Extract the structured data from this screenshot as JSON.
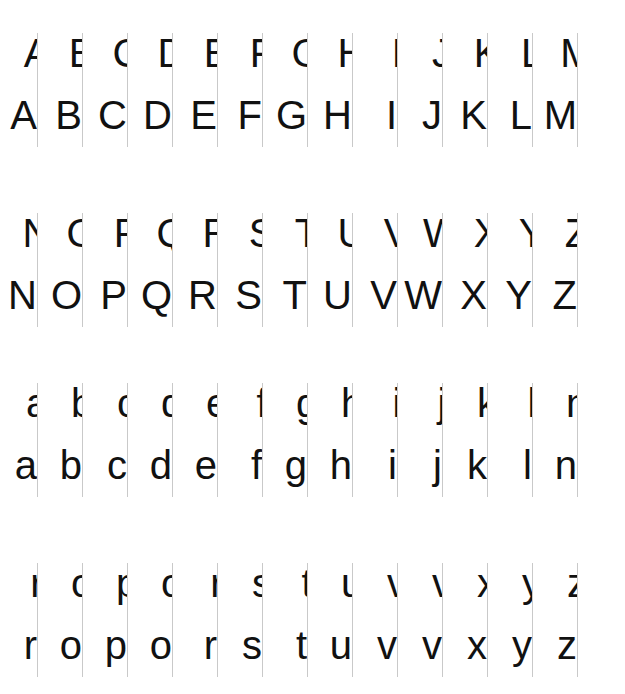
{
  "page": {
    "background_color": "#ffffff",
    "glyph_color": "#111111",
    "guide_color": "#c9c9c9",
    "width": 625,
    "height": 694
  },
  "layout": {
    "columns": 13,
    "column_spacing": 45,
    "first_column_x": 37,
    "block_tops": [
      33,
      213,
      383,
      563
    ],
    "sub_row_offset": 62
  },
  "blocks": [
    {
      "name": "uppercase-a-m",
      "case": "uppercase",
      "top": 33,
      "letters": [
        "A",
        "B",
        "C",
        "D",
        "E",
        "F",
        "G",
        "H",
        "I",
        "J",
        "K",
        "L",
        "M"
      ]
    },
    {
      "name": "uppercase-n-z",
      "case": "uppercase",
      "top": 213,
      "letters": [
        "N",
        "O",
        "P",
        "Q",
        "R",
        "S",
        "T",
        "U",
        "V",
        "W",
        "X",
        "Y",
        "Z"
      ]
    },
    {
      "name": "lowercase-a-n",
      "case": "lowercase",
      "top": 383,
      "letters": [
        "a",
        "b",
        "c",
        "d",
        "e",
        "f",
        "g",
        "h",
        "i",
        "j",
        "k",
        "l",
        "n"
      ]
    },
    {
      "name": "lowercase-o-z",
      "case": "lowercase",
      "top": 563,
      "letters": [
        "r",
        "o",
        "p",
        "o",
        "r",
        "s",
        "t",
        "u",
        "v",
        "v",
        "x",
        "y",
        "z"
      ]
    }
  ],
  "rows": {
    "left_half_label": "left half of glyph",
    "right_half_label": "right half of glyph"
  }
}
